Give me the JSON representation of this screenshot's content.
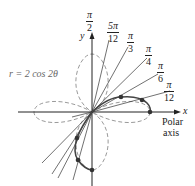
{
  "diagram": {
    "equation": "r = 2 cos 2θ",
    "axes": {
      "x_label": "x",
      "y_label": "y",
      "polar_axis_label_line1": "Polar",
      "polar_axis_label_line2": "axis"
    },
    "angle_labels": [
      {
        "num": "π",
        "den": "2"
      },
      {
        "num": "5π",
        "den": "12"
      },
      {
        "num": "π",
        "den": "3"
      },
      {
        "num": "π",
        "den": "4"
      },
      {
        "num": "π",
        "den": "6"
      },
      {
        "num": "π",
        "den": "12"
      }
    ],
    "curve": {
      "type": "four-leaved rose",
      "highlighted_part": "solid arc for 0 ≤ θ ≤ π/4 plus lobe traced for θ in [π/4, π/2] (negative r, drawn in third quadrant)",
      "dashed_part": "remaining lobes",
      "plotted_points_count": 6
    },
    "colors": {
      "axes": "#222222",
      "rays": "#333333",
      "solid_curve": "#444444",
      "dashed_curve": "#999999",
      "points": "#333333"
    }
  }
}
